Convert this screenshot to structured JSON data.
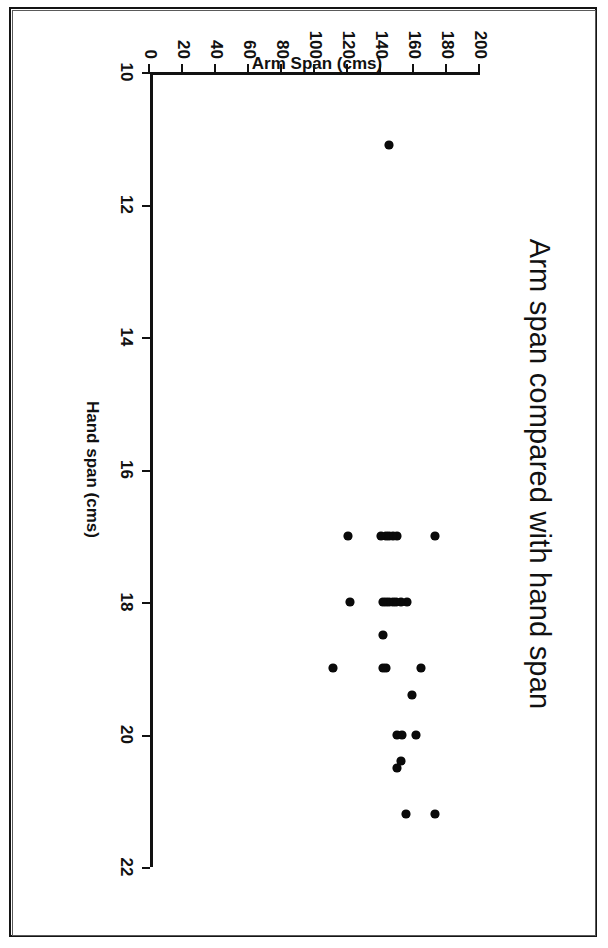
{
  "chart_data": {
    "type": "scatter",
    "title": "Arm span compared with hand span",
    "xlabel": "Hand span (cms)",
    "ylabel": "Arm Span (cms)",
    "xlim": [
      10,
      22
    ],
    "ylim": [
      0,
      200
    ],
    "xticks": [
      10,
      12,
      14,
      16,
      18,
      20,
      22
    ],
    "xtick_labels": [
      "10",
      "12",
      "14",
      "16",
      "18",
      "20",
      "22"
    ],
    "yticks": [
      0,
      20,
      40,
      60,
      80,
      100,
      120,
      140,
      160,
      180,
      200
    ],
    "ytick_labels": [
      "0",
      "20",
      "40",
      "60",
      "80",
      "100",
      "120",
      "140",
      "160",
      "180",
      "200"
    ],
    "grid": false,
    "legend": null,
    "marker": "diamond",
    "marker_color": "#0a0a0a",
    "series": [
      {
        "name": "Students",
        "points": [
          [
            11.1,
            145
          ],
          [
            17.0,
            173
          ],
          [
            17.0,
            150
          ],
          [
            17.0,
            147
          ],
          [
            17.0,
            145
          ],
          [
            17.0,
            143
          ],
          [
            17.0,
            140
          ],
          [
            17.0,
            120
          ],
          [
            18.0,
            156
          ],
          [
            18.0,
            152
          ],
          [
            18.0,
            149
          ],
          [
            18.0,
            147
          ],
          [
            18.0,
            145
          ],
          [
            18.0,
            143
          ],
          [
            18.0,
            141
          ],
          [
            18.0,
            121
          ],
          [
            18.5,
            141
          ],
          [
            19.0,
            164
          ],
          [
            19.0,
            143
          ],
          [
            19.0,
            141
          ],
          [
            19.0,
            111
          ],
          [
            19.4,
            159
          ],
          [
            20.0,
            161
          ],
          [
            20.0,
            153
          ],
          [
            20.0,
            150
          ],
          [
            20.4,
            152
          ],
          [
            20.5,
            150
          ],
          [
            21.2,
            173
          ],
          [
            21.2,
            155
          ]
        ]
      }
    ]
  },
  "figure": {
    "title_text": "Arm span compared with hand span",
    "x_axis_title": "Hand span (cms)",
    "y_axis_title": "Arm Span (cms)"
  }
}
